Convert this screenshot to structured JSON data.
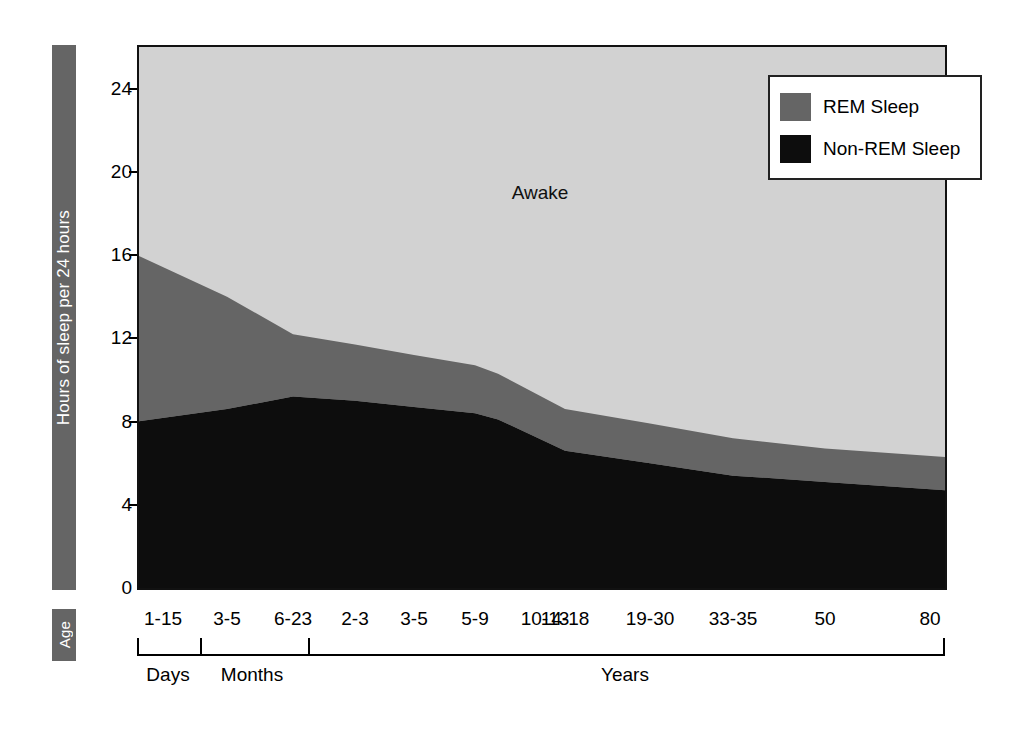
{
  "chart_data": {
    "type": "area",
    "title": "",
    "subtitle": "",
    "xlabel": "Age",
    "ylabel": "Hours of sleep per 24 hours",
    "ylim": [
      0,
      26
    ],
    "yticks": [
      0,
      4,
      8,
      12,
      16,
      20,
      24
    ],
    "ytick_labels": [
      "0",
      "4",
      "8",
      "12",
      "16",
      "20",
      "24"
    ],
    "grid": false,
    "stacked": true,
    "legend_position": "top-right",
    "categories": [
      "1-15",
      "3-5",
      "6-23",
      "2-3",
      "3-5",
      "5-9",
      "10-13",
      "14-18",
      "19-30",
      "33-35",
      "50",
      "80"
    ],
    "category_units": [
      "Days",
      "Months",
      "Months",
      "Years",
      "Years",
      "Years",
      "Years",
      "Years",
      "Years",
      "Years",
      "Years",
      "Years"
    ],
    "series": [
      {
        "name": "Non-REM Sleep",
        "color": "#0d0d0d",
        "values": [
          8.0,
          8.6,
          9.2,
          9.0,
          8.7,
          8.4,
          8.1,
          6.6,
          6.0,
          5.4,
          5.1,
          4.7
        ]
      },
      {
        "name": "REM Sleep",
        "color": "#656565",
        "values": [
          8.0,
          5.4,
          3.0,
          2.7,
          2.5,
          2.3,
          2.2,
          2.0,
          1.9,
          1.8,
          1.6,
          1.6
        ]
      },
      {
        "name": "Awake",
        "color": "#d2d2d2",
        "values": [
          8.0,
          10.0,
          11.8,
          12.3,
          12.8,
          13.3,
          13.7,
          15.4,
          16.1,
          16.8,
          17.3,
          17.7
        ]
      }
    ],
    "total_sleep": [
      16.0,
      14.0,
      12.2,
      11.7,
      11.2,
      10.7,
      10.3,
      8.6,
      7.9,
      7.2,
      6.7,
      6.3
    ],
    "annotations": [
      {
        "text": "Awake",
        "x_category": "5-9",
        "y_hours": 19.0
      }
    ],
    "axis_groups": [
      {
        "label": "Days",
        "start_category": "1-15",
        "end_category": "1-15"
      },
      {
        "label": "Months",
        "start_category": "3-5",
        "end_category": "6-23"
      },
      {
        "label": "Years",
        "start_category": "2-3",
        "end_category": "80"
      }
    ]
  },
  "labels": {
    "yaxis_title": "Hours of sleep per 24 hours",
    "age_title": "Age",
    "awake": "Awake"
  },
  "legend": {
    "items": [
      {
        "label": "REM Sleep",
        "color": "#656565"
      },
      {
        "label": "Non-REM Sleep",
        "color": "#0d0d0d"
      }
    ]
  },
  "colors": {
    "awake": "#d2d2d2",
    "rem": "#656565",
    "non_rem": "#0d0d0d",
    "axis": "#000000",
    "bar_background": "#656565",
    "bar_text": "#ffffff"
  }
}
